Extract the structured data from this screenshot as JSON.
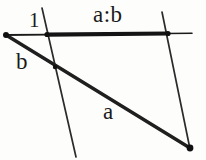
{
  "figure": {
    "name": "ratio-construction-diagram",
    "background_color": "#fdfdfb",
    "ink_color": "#1a1a1a",
    "width": 206,
    "height": 160,
    "labels": {
      "ratio": "a:b",
      "unit": "1",
      "segment_b": "b",
      "segment_a": "a"
    },
    "geometry": {
      "apex_point": {
        "x": 6,
        "y": 35
      },
      "terminal_point": {
        "x": 190,
        "y": 148
      },
      "horizontal_line": {
        "x1": 6,
        "y1": 35,
        "x2": 192,
        "y2": 33,
        "thick_from_x": 47,
        "thick_to_x": 168,
        "thin_width": 1.6,
        "thick_width": 4.2
      },
      "diagonal_line": {
        "x1": 6,
        "y1": 35,
        "x2": 190,
        "y2": 148,
        "stroke_width": 3.4
      },
      "transversal_left": {
        "x1": 42,
        "y1": 8,
        "x2": 76,
        "y2": 157,
        "stroke_width": 1.7
      },
      "transversal_right": {
        "x1": 162,
        "y1": 12,
        "x2": 190,
        "y2": 149,
        "stroke_width": 1.7
      },
      "node_markers": [
        {
          "name": "apex",
          "x": 6,
          "y": 35,
          "r": 3.0
        },
        {
          "name": "left-transversal-on-baseline",
          "x": 47,
          "y": 34.5,
          "r": 2.6
        },
        {
          "name": "left-transversal-on-diagonal",
          "x": 55,
          "y": 67,
          "r": 2.2
        },
        {
          "name": "right-transversal-on-baseline",
          "x": 168,
          "y": 33.5,
          "r": 2.6
        },
        {
          "name": "terminal",
          "x": 190,
          "y": 148,
          "r": 3.4
        }
      ]
    }
  }
}
